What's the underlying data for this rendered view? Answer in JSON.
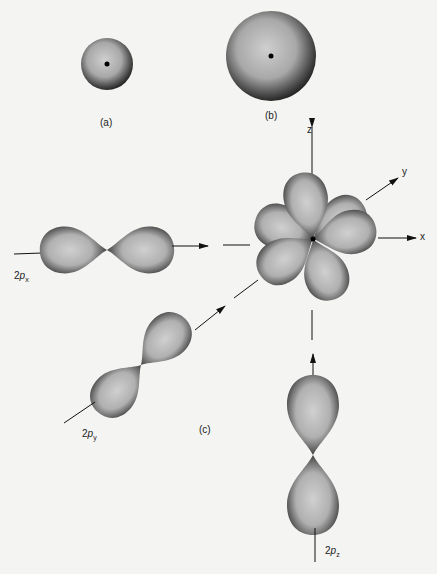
{
  "figure": {
    "panels": [
      {
        "id": "a",
        "label": "(a)",
        "description": "1s orbital sphere"
      },
      {
        "id": "b",
        "label": "(b)",
        "description": "2s orbital sphere"
      },
      {
        "id": "c",
        "label": "(c)",
        "description": "2p orbitals"
      }
    ],
    "orbitals": {
      "px": {
        "prefix": "2",
        "p": "p",
        "sub": "x"
      },
      "py": {
        "prefix": "2",
        "p": "p",
        "sub": "y"
      },
      "pz": {
        "prefix": "2",
        "p": "p",
        "sub": "z"
      }
    },
    "axes": {
      "x": "x",
      "y": "y",
      "z": "z"
    },
    "colors": {
      "background": "#f4f4f2",
      "lobe_light": "#c8c8c8",
      "lobe_dark": "#2a2a2a",
      "line": "#111111"
    }
  }
}
